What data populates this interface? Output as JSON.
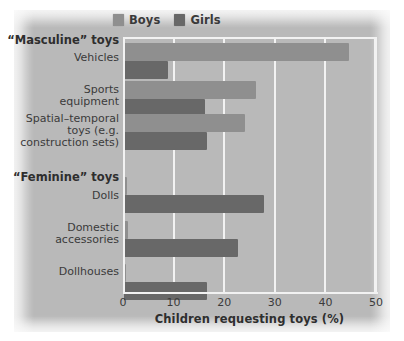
{
  "chart_data": {
    "type": "bar",
    "orientation": "horizontal",
    "title": "",
    "xlabel": "Children requesting toys (%)",
    "ylabel": "",
    "xlim": [
      0,
      50
    ],
    "xticks": [
      0,
      10,
      20,
      30,
      40,
      50
    ],
    "grid": true,
    "legend_position": "top",
    "legend": [
      "Boys",
      "Girls"
    ],
    "group_headings": [
      "“Masculine” toys",
      "“Feminine” toys"
    ],
    "categories": [
      "Vehicles",
      "Sports equipment",
      "Spatial–temporal toys (e.g. construction sets)",
      "Dolls",
      "Domestic accessories",
      "Dollhouses"
    ],
    "series": [
      {
        "name": "Boys",
        "color": "#8f8f8f",
        "values": [
          44.5,
          26.0,
          24.0,
          0.5,
          0.7,
          0.4
        ]
      },
      {
        "name": "Girls",
        "color": "#686868",
        "values": [
          8.7,
          16.0,
          16.4,
          27.7,
          22.5,
          16.5
        ]
      }
    ]
  },
  "legend": {
    "boys": {
      "label": "Boys",
      "color": "#8f8f8f"
    },
    "girls": {
      "label": "Girls",
      "color": "#686868"
    }
  },
  "axis": {
    "x_title": "Children requesting toys (%)",
    "ticks": [
      "0",
      "10",
      "20",
      "30",
      "40",
      "50"
    ]
  },
  "labels": {
    "masculine_heading": "“Masculine” toys",
    "vehicles": "Vehicles",
    "sports_1": "Sports",
    "sports_2": "equipment",
    "spatial_1": "Spatial–temporal",
    "spatial_2": "toys (e.g.",
    "spatial_3": "construction sets)",
    "feminine_heading": "“Feminine” toys",
    "dolls": "Dolls",
    "domestic_1": "Domestic",
    "domestic_2": "accessories",
    "dollhouses": "Dollhouses"
  }
}
